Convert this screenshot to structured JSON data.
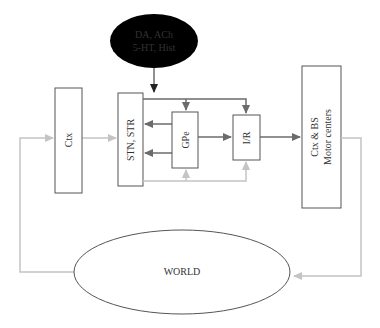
{
  "diagram": {
    "neuromodulators": {
      "line1": "DA, ACh",
      "line2": "5-HT, Hist"
    },
    "ctx": "Ctx",
    "stn_str": "STN,  STR",
    "gpe": "GPe",
    "ir": "I/R",
    "motor_line1": "Ctx & BS",
    "motor_line2": "Motor centers",
    "world": "WORLD"
  },
  "colors": {
    "box_stroke": "#555555",
    "dark_arrow": "#6b6b6b",
    "light_arrow": "#c4c4c4",
    "ellipse_fill": "#000000",
    "ellipse_text": "#ffffff"
  }
}
